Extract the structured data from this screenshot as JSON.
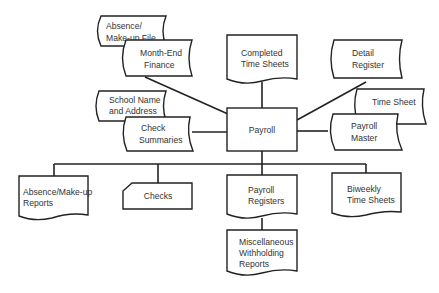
{
  "diagram": {
    "type": "system flowchart",
    "center": {
      "label": "Payroll",
      "shape": "process"
    },
    "inputs": [
      {
        "lines": [
          "Absence/",
          "Make-up  File"
        ],
        "shape": "stored-data"
      },
      {
        "lines": [
          "Month-End",
          "Finance"
        ],
        "shape": "stored-data"
      },
      {
        "lines": [
          "Completed",
          "Time Sheets"
        ],
        "shape": "document"
      },
      {
        "lines": [
          "Detail",
          "Register"
        ],
        "shape": "stored-data"
      },
      {
        "lines": [
          "School Name",
          "and Address"
        ],
        "shape": "stored-data"
      },
      {
        "lines": [
          "Check",
          "Summaries"
        ],
        "shape": "stored-data"
      },
      {
        "lines": [
          "Time Sheet"
        ],
        "shape": "stored-data"
      },
      {
        "lines": [
          "Payroll",
          "Master"
        ],
        "shape": "stored-data"
      }
    ],
    "outputs": [
      {
        "lines": [
          "Absence/Make-up",
          "Reports"
        ],
        "shape": "document"
      },
      {
        "lines": [
          "Checks"
        ],
        "shape": "card"
      },
      {
        "lines": [
          "Payroll",
          "Registers"
        ],
        "shape": "document"
      },
      {
        "lines": [
          "Biweekly",
          "Time Sheets"
        ],
        "shape": "document"
      },
      {
        "lines": [
          "Miscellaneous",
          "Withholding",
          "Reports"
        ],
        "shape": "document"
      }
    ],
    "colors": {
      "stroke": "#222222",
      "text": "#333333",
      "background": "#ffffff"
    }
  }
}
